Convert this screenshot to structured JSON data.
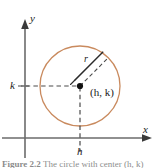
{
  "figure": {
    "title": "Circle with center (h, k) and radius r",
    "caption_label": "Figure 2.2",
    "caption_text": "The circle with center (h, k) and radius r.",
    "background_color": "#ffffff"
  },
  "axes": {
    "x_label": "x",
    "y_label": "y",
    "axis_color": "#6b6b6b",
    "origin": {
      "x": 25,
      "y": 138
    },
    "x_axis": {
      "from_x": 2,
      "to_x": 152,
      "y": 138,
      "arrow": "right"
    },
    "y_axis": {
      "x": 25,
      "from_y": 158,
      "to_y": 20,
      "arrow": "up"
    }
  },
  "ticks": [
    {
      "name": "k",
      "label": "k",
      "axis": "y",
      "value_px": 86
    },
    {
      "name": "h",
      "label": "h",
      "axis": "x",
      "value_px": 80
    }
  ],
  "circle": {
    "center_label": "(h, k)",
    "center_x": 80,
    "center_y": 86,
    "radius": 40,
    "stroke_color": "#c98a5e",
    "stroke_width": 1.3
  },
  "radius": {
    "label": "r",
    "dash_color": "#4a4a4a",
    "brace_color": "#2b2b2b",
    "end_x": 108,
    "end_y": 58
  },
  "guides": {
    "horizontal_dash": {
      "from_x": 25,
      "to_x": 80,
      "y": 86
    },
    "vertical_dash": {
      "x": 80,
      "from_y": 86,
      "to_y": 138
    },
    "dash_color": "#4a4a4a"
  }
}
